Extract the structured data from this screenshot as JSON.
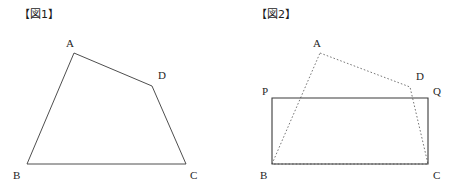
{
  "document": {
    "kind": "math-worksheet-figures",
    "background_color": "#ffffff",
    "stroke_color": "#3a3a3a",
    "dotted_stroke_color": "#555555",
    "label_color": "#262626"
  },
  "figures": [
    {
      "id": "figure-1",
      "caption": "【図1】",
      "caption_x": 19,
      "caption_y": 9,
      "shape_type": "quadrilateral",
      "line_style": "solid",
      "vertices": [
        {
          "name": "A",
          "x": 74,
          "y": 53,
          "label_x": 66,
          "label_y": 47
        },
        {
          "name": "D",
          "x": 152,
          "y": 86,
          "label_x": 158,
          "label_y": 79
        },
        {
          "name": "C",
          "x": 186,
          "y": 164,
          "label_x": 190,
          "label_y": 179
        },
        {
          "name": "B",
          "x": 27,
          "y": 164,
          "label_x": 13,
          "label_y": 179
        }
      ],
      "edges": [
        {
          "from": "A",
          "to": "D",
          "style": "solid"
        },
        {
          "from": "D",
          "to": "C",
          "style": "solid"
        },
        {
          "from": "C",
          "to": "B",
          "style": "solid"
        },
        {
          "from": "B",
          "to": "A",
          "style": "solid"
        }
      ],
      "path": "M 74,53 L 152,86 L 186,164 L 27,164 Z"
    },
    {
      "id": "figure-2",
      "caption": "【図2】",
      "caption_x": 29,
      "caption_y": 9,
      "shape_type": "rectangle-with-overlaid-quadrilateral",
      "rectangle": {
        "name": "PQCB",
        "line_style": "solid",
        "path": "M 45,98 L 201,98 L 201,164 L 45,164 Z",
        "vertices": [
          {
            "name": "P",
            "x": 45,
            "y": 98,
            "label_x": 35,
            "label_y": 95
          },
          {
            "name": "Q",
            "x": 201,
            "y": 98,
            "label_x": 206,
            "label_y": 95
          },
          {
            "name": "C",
            "x": 201,
            "y": 164,
            "label_x": 206,
            "label_y": 179
          },
          {
            "name": "B",
            "x": 45,
            "y": 164,
            "label_x": 33,
            "label_y": 179
          }
        ]
      },
      "overlay_quadrilateral": {
        "name": "ABCD",
        "line_style": "dotted",
        "path": "M 93,53 L 183,87 L 201,164 L 45,164 Z",
        "vertices": [
          {
            "name": "A",
            "x": 93,
            "y": 53,
            "label_x": 86,
            "label_y": 47
          },
          {
            "name": "D",
            "x": 183,
            "y": 87,
            "label_x": 189,
            "label_y": 80
          }
        ]
      }
    }
  ]
}
